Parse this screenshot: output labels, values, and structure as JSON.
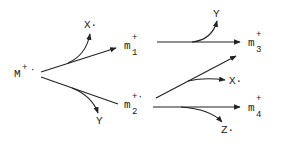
{
  "diagram": {
    "type": "fragmentation-scheme",
    "colors": {
      "ink": "#222222",
      "background": "#ffffff"
    },
    "nodes": {
      "parent": {
        "base": "M",
        "sup": "+",
        "dot": "·"
      },
      "m1": {
        "base": "m",
        "sub": "1",
        "sup": "+"
      },
      "m2": {
        "base": "m",
        "sub": "2",
        "sup": "+·"
      },
      "m3": {
        "base": "m",
        "sub": "3",
        "sup": "+"
      },
      "m4": {
        "base": "m",
        "sub": "4",
        "sup": "+"
      }
    },
    "neutrals": {
      "x_from_parent": "X·",
      "y_from_parent": "Y",
      "y_from_m1": "Y",
      "x_from_m2": "X·",
      "z_from_m2": "Z·"
    },
    "edges": [
      {
        "from": "M+·",
        "to": "m1+",
        "loss": "X·"
      },
      {
        "from": "M+·",
        "to": "m2+·",
        "loss": "Y"
      },
      {
        "from": "m1+",
        "to": "m3+",
        "loss": "Y"
      },
      {
        "from": "m2+·",
        "to": "(unlabeled)",
        "loss": "X·"
      },
      {
        "from": "m2+·",
        "to": "m4+",
        "loss": "Z·"
      }
    ]
  }
}
